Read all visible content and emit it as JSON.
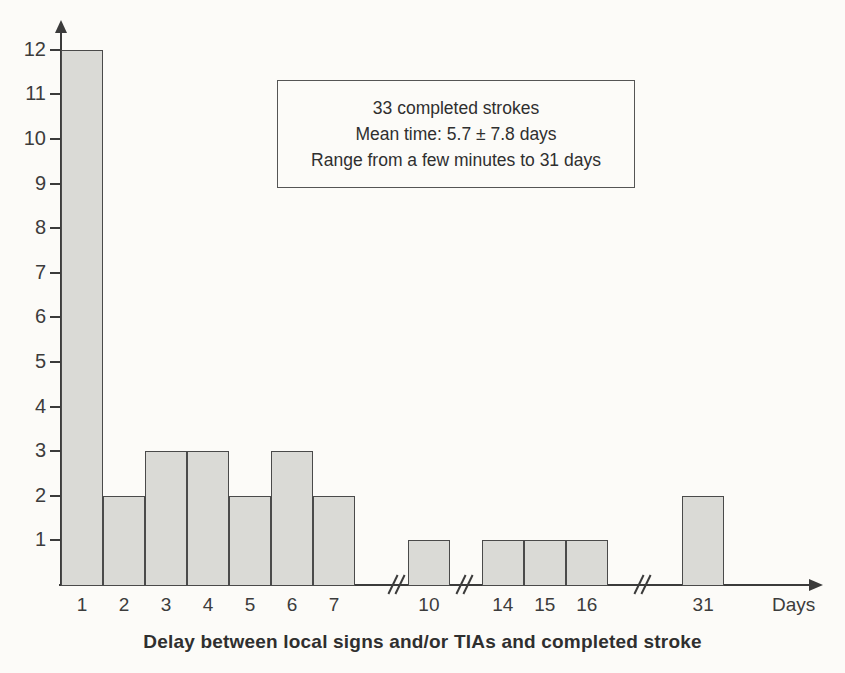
{
  "chart_data": {
    "type": "bar",
    "title": "",
    "categories": [
      "1",
      "2",
      "3",
      "4",
      "5",
      "6",
      "7",
      "10",
      "14",
      "15",
      "16",
      "31"
    ],
    "values": [
      12,
      2,
      3,
      3,
      2,
      3,
      2,
      1,
      1,
      1,
      1,
      2
    ],
    "xlabel": "Delay between local signs and/or TIAs and completed stroke",
    "x_unit_label": "Days",
    "ylabel": "",
    "ylim": [
      0,
      12
    ],
    "y_ticks": [
      1,
      2,
      3,
      4,
      5,
      6,
      7,
      8,
      9,
      10,
      11,
      12
    ],
    "x_axis_breaks_between": [
      [
        7,
        10
      ],
      [
        10,
        14
      ],
      [
        16,
        31
      ]
    ],
    "grid": false,
    "legend": null,
    "annotation_lines": [
      "33 completed strokes",
      "Mean time: 5.7 ± 7.8 days",
      "Range from a few minutes to 31 days"
    ]
  },
  "colors": {
    "background": "#fcfbf8",
    "bar_fill": "#dadad6",
    "bar_border": "#4a4a4a",
    "axis": "#3b3b3b",
    "tick_label": "#3c3c3c",
    "text": "#2f2f2f",
    "annotation_border": "#555555"
  }
}
